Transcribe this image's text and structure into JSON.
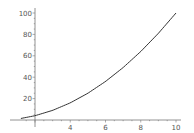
{
  "chart_data": {
    "type": "line",
    "title": "",
    "xlabel": "",
    "ylabel": "",
    "xlim": [
      1.2,
      10.2
    ],
    "ylim": [
      0,
      102
    ],
    "axes_origin": [
      2,
      0
    ],
    "grid": false,
    "legend": null,
    "x_ticks": [
      4,
      6,
      8,
      10
    ],
    "x_tick_labels": [
      "4",
      "6",
      "8",
      "10"
    ],
    "y_ticks": [
      20,
      40,
      60,
      80,
      100
    ],
    "y_tick_labels": [
      "20",
      "40",
      "60",
      "80",
      "100"
    ],
    "series": [
      {
        "name": "x^2",
        "color": "#333333",
        "x": [
          1.2,
          2,
          3,
          4,
          5,
          6,
          7,
          8,
          9,
          10
        ],
        "y": [
          1.44,
          4,
          9,
          16,
          25,
          36,
          49,
          64,
          81,
          100
        ]
      }
    ]
  },
  "colors": {
    "axis": "#777777",
    "curve": "#333333",
    "background": "#ffffff"
  }
}
